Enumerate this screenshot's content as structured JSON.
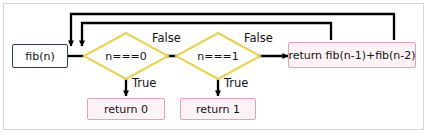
{
  "diagram": {
    "colors": {
      "frame_border": "#d6d6d6",
      "background": "#ffffff",
      "start_border": "#2f3a63",
      "decision_border": "#e8d24a",
      "return_border": "#e8a0b4",
      "return_fill": "#fdf2f5",
      "edge": "#000000",
      "text": "#111111"
    },
    "nodes": {
      "start": {
        "label": "fib(n)",
        "shape": "rect"
      },
      "decision_zero": {
        "label": "n===0",
        "shape": "diamond"
      },
      "decision_one": {
        "label": "n===1",
        "shape": "diamond"
      },
      "return_zero": {
        "label": "return 0",
        "shape": "rect"
      },
      "return_one": {
        "label": "return 1",
        "shape": "rect"
      },
      "return_recursive": {
        "label": "return fib(n-1)+fib(n-2)",
        "shape": "rect"
      }
    },
    "edge_labels": {
      "false_first": "False",
      "false_second": "False",
      "true_first": "True",
      "true_second": "True"
    }
  }
}
